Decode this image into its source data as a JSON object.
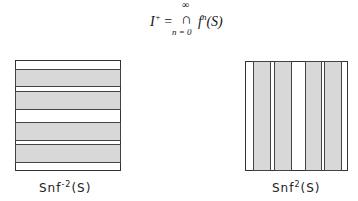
{
  "formula": {
    "lhs": "I",
    "lhs_sup": "+",
    "equals": "=",
    "operator": "∩",
    "upper_limit": "∞",
    "lower_limit": "n = 0",
    "rhs": "f",
    "rhs_sup": "n",
    "rhs_arg": "(S)"
  },
  "diagrams": [
    {
      "orientation": "horizontal",
      "label_base": "Snf",
      "label_sup": "-2",
      "label_arg": "(S)",
      "bands": 4
    },
    {
      "orientation": "vertical",
      "label_base": "Snf",
      "label_sup": "2",
      "label_arg": "(S)",
      "bands": 4
    }
  ]
}
